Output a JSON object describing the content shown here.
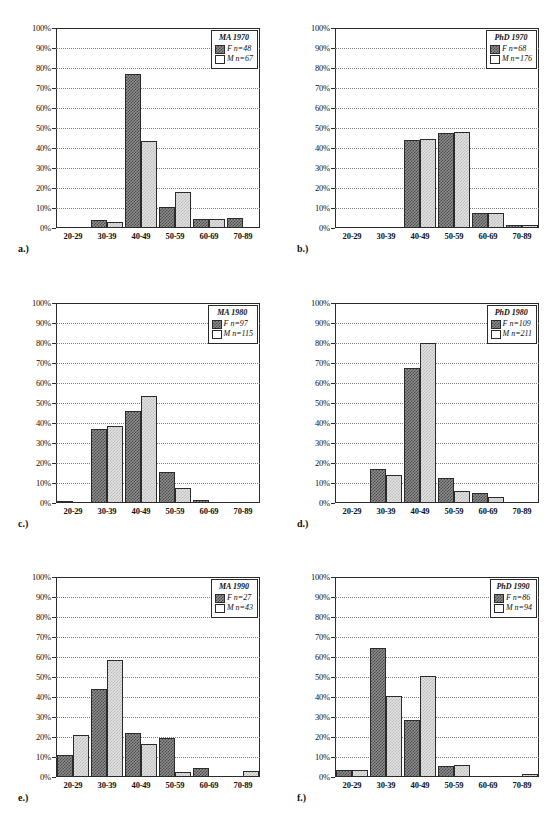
{
  "figure": {
    "panel_captions": [
      "a.)",
      "b.)",
      "c.)",
      "d.)",
      "e.)",
      "f.)"
    ],
    "y_ticks": [
      "100%",
      "90%",
      "80%",
      "70%",
      "60%",
      "50%",
      "40%",
      "30%",
      "20%",
      "10%",
      "0%"
    ],
    "categories": [
      "20-29",
      "30-39",
      "40-49",
      "50-59",
      "60-69",
      "70-89"
    ],
    "series_colors": {
      "female": "#4a4a4a",
      "male": "#e2e2e2",
      "axis": "#2b2b2b",
      "grid": "#7d7d7d"
    }
  },
  "chart_data": [
    {
      "type": "bar",
      "title": "MA 1970",
      "caption": "a.)",
      "categories": [
        "20-29",
        "30-39",
        "40-49",
        "50-59",
        "60-69",
        "70-89"
      ],
      "series": [
        {
          "name": "F n=48",
          "label": "F",
          "n": 48,
          "values": [
            0,
            4,
            77,
            10.5,
            4.5,
            5
          ]
        },
        {
          "name": "M n=67",
          "label": "M",
          "n": 67,
          "values": [
            0,
            3,
            43.5,
            18,
            4.5,
            0
          ]
        }
      ],
      "legend": {
        "title": "MA 1970",
        "entries": [
          "F n=48",
          "M n=67"
        ],
        "position": "top-right"
      },
      "xlabel": "",
      "ylabel": "",
      "ylim": [
        0,
        100
      ],
      "grid": true
    },
    {
      "type": "bar",
      "title": "PhD 1970",
      "caption": "b.)",
      "categories": [
        "20-29",
        "30-39",
        "40-49",
        "50-59",
        "60-69",
        "70-89"
      ],
      "series": [
        {
          "name": "F n=68",
          "label": "F",
          "n": 68,
          "values": [
            0,
            0,
            44,
            47.5,
            7.5,
            1.5
          ]
        },
        {
          "name": "M n=176",
          "label": "M",
          "n": 176,
          "values": [
            0,
            0,
            44.5,
            48,
            7.5,
            1.5
          ]
        }
      ],
      "legend": {
        "title": "PhD 1970",
        "entries": [
          "F n=68",
          "M n=176"
        ],
        "position": "top-right"
      },
      "xlabel": "",
      "ylabel": "",
      "ylim": [
        0,
        100
      ],
      "grid": true
    },
    {
      "type": "bar",
      "title": "MA 1980",
      "caption": "c.)",
      "categories": [
        "20-29",
        "30-39",
        "40-49",
        "50-59",
        "60-69",
        "70-89"
      ],
      "series": [
        {
          "name": "F n=97",
          "label": "F",
          "n": 97,
          "values": [
            1,
            37,
            46,
            15.5,
            1.5,
            0
          ]
        },
        {
          "name": "M n=115",
          "label": "M",
          "n": 115,
          "values": [
            0,
            38.5,
            53.5,
            7.5,
            0,
            0
          ]
        }
      ],
      "legend": {
        "title": "MA 1980",
        "entries": [
          "F n=97",
          "M n=115"
        ],
        "position": "top-right"
      },
      "xlabel": "",
      "ylabel": "",
      "ylim": [
        0,
        100
      ],
      "grid": true
    },
    {
      "type": "bar",
      "title": "PhD 1980",
      "caption": "d.)",
      "categories": [
        "20-29",
        "30-39",
        "40-49",
        "50-59",
        "60-69",
        "70-89"
      ],
      "series": [
        {
          "name": "F n=109",
          "label": "F",
          "n": 109,
          "values": [
            0,
            17,
            67.5,
            12.5,
            5,
            0
          ]
        },
        {
          "name": "M n=211",
          "label": "M",
          "n": 211,
          "values": [
            0,
            14,
            80,
            6,
            3,
            0
          ]
        }
      ],
      "legend": {
        "title": "PhD 1980",
        "entries": [
          "F n=109",
          "M n=211"
        ],
        "position": "top-right"
      },
      "xlabel": "",
      "ylabel": "",
      "ylim": [
        0,
        100
      ],
      "grid": true
    },
    {
      "type": "bar",
      "title": "MA 1990",
      "caption": "e.)",
      "categories": [
        "20-29",
        "30-39",
        "40-49",
        "50-59",
        "60-69",
        "70-89"
      ],
      "series": [
        {
          "name": "F n=27",
          "label": "F",
          "n": 27,
          "values": [
            11,
            44,
            22,
            19.5,
            4.5,
            0
          ]
        },
        {
          "name": "M n=43",
          "label": "M",
          "n": 43,
          "values": [
            21,
            58.5,
            16.5,
            2.5,
            0,
            3
          ]
        }
      ],
      "legend": {
        "title": "MA 1990",
        "entries": [
          "F n=27",
          "M n=43"
        ],
        "position": "top-right"
      },
      "xlabel": "",
      "ylabel": "",
      "ylim": [
        0,
        100
      ],
      "grid": true
    },
    {
      "type": "bar",
      "title": "PhD 1990",
      "caption": "f.)",
      "categories": [
        "20-29",
        "30-39",
        "40-49",
        "50-59",
        "60-69",
        "70-89"
      ],
      "series": [
        {
          "name": "F n=86",
          "label": "F",
          "n": 86,
          "values": [
            3.5,
            64.5,
            28.5,
            5.5,
            0,
            0
          ]
        },
        {
          "name": "M n=94",
          "label": "M",
          "n": 94,
          "values": [
            3.5,
            40.5,
            50.5,
            6,
            0,
            1.5
          ]
        }
      ],
      "legend": {
        "title": "PhD 1990",
        "entries": [
          "F n=86",
          "M n=94"
        ],
        "position": "top-right"
      },
      "xlabel": "",
      "ylabel": "",
      "ylim": [
        0,
        100
      ],
      "grid": true
    }
  ]
}
